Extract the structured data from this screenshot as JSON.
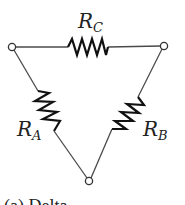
{
  "diagram": {
    "type": "delta-resistor-network",
    "colors": {
      "wire": "#4a4a4a",
      "resistor": "#111111",
      "terminal_fill": "#ffffff"
    },
    "terminals": [
      {
        "id": "left",
        "x": 12,
        "y": 47
      },
      {
        "id": "right",
        "x": 164,
        "y": 46
      },
      {
        "id": "bottom",
        "x": 89,
        "y": 181
      }
    ],
    "resistors": [
      {
        "id": "RC",
        "label_main": "R",
        "label_sub": "C",
        "position": "top"
      },
      {
        "id": "RA",
        "label_main": "R",
        "label_sub": "A",
        "position": "left"
      },
      {
        "id": "RB",
        "label_main": "R",
        "label_sub": "B",
        "position": "right"
      }
    ],
    "caption": "(a) Delta"
  }
}
